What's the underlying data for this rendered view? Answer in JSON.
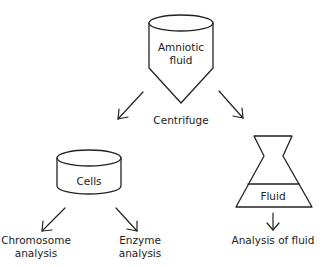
{
  "diagram": {
    "type": "process-flow",
    "colors": {
      "line": "#222222",
      "background": "#ffffff"
    },
    "nodes": {
      "amniotic_fluid": {
        "shape": "centrifuge-tube",
        "line1": "Amniotic",
        "line2": "fluid"
      },
      "centrifuge": {
        "label": "Centrifuge"
      },
      "cells": {
        "shape": "cylinder",
        "label": "Cells"
      },
      "fluid": {
        "shape": "flask",
        "label": "Fluid"
      },
      "chromosome_analysis": {
        "line1": "Chromosome",
        "line2": "analysis"
      },
      "enzyme_analysis": {
        "line1": "Enzyme",
        "line2": "analysis"
      },
      "analysis_of_fluid": {
        "label": "Analysis of fluid"
      }
    },
    "edges": [
      {
        "from": "amniotic_fluid",
        "to": "cells",
        "via": "Centrifuge"
      },
      {
        "from": "amniotic_fluid",
        "to": "fluid",
        "via": "Centrifuge"
      },
      {
        "from": "cells",
        "to": "chromosome_analysis"
      },
      {
        "from": "cells",
        "to": "enzyme_analysis"
      },
      {
        "from": "fluid",
        "to": "analysis_of_fluid"
      }
    ]
  }
}
